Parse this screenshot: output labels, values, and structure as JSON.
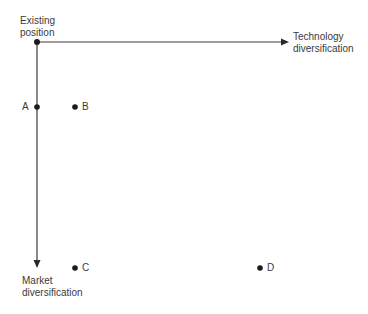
{
  "diagram": {
    "origin": {
      "label_line1": "Existing",
      "label_line2": "position"
    },
    "x_axis": {
      "label_line1": "Technology",
      "label_line2": "diversification"
    },
    "y_axis": {
      "label_line1": "Market",
      "label_line2": "diversification"
    },
    "points": [
      {
        "id": "A",
        "label": "A"
      },
      {
        "id": "B",
        "label": "B"
      },
      {
        "id": "C",
        "label": "C"
      },
      {
        "id": "D",
        "label": "D"
      }
    ],
    "colors": {
      "line": "#3a3a3a",
      "text": "#3a3a3a",
      "background": "#ffffff"
    }
  }
}
